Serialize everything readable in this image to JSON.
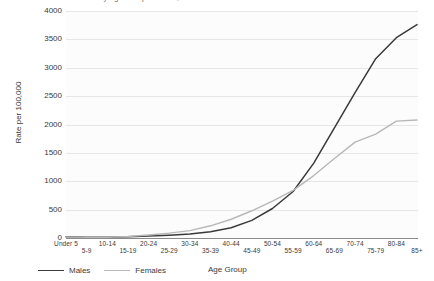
{
  "chart_data": {
    "type": "line",
    "title": "Rate of Cancer Incidence by Age Group and Sex, 2015",
    "xlabel": "Age Group",
    "ylabel": "Rate per 100,000",
    "ylim": [
      0,
      4000
    ],
    "yticks": [
      4000,
      3500,
      3000,
      2500,
      2000,
      1500,
      1000,
      500,
      0
    ],
    "grid": true,
    "legend_position": "bottom-left",
    "categories": [
      "Under 5",
      "5-9",
      "10-14",
      "15-19",
      "20-24",
      "25-29",
      "30-34",
      "35-39",
      "40-44",
      "45-49",
      "50-54",
      "55-59",
      "60-64",
      "65-69",
      "70-74",
      "75-79",
      "80-84",
      "85+"
    ],
    "series": [
      {
        "name": "Males",
        "color": "#3a3a3a",
        "values": [
          20,
          12,
          14,
          22,
          35,
          50,
          72,
          110,
          180,
          310,
          520,
          820,
          1320,
          1940,
          2560,
          3160,
          3530,
          3760
        ]
      },
      {
        "name": "Females",
        "color": "#b8b8b8",
        "values": [
          18,
          11,
          13,
          26,
          52,
          85,
          130,
          215,
          330,
          480,
          650,
          840,
          1100,
          1400,
          1690,
          1830,
          2060,
          2080
        ]
      }
    ]
  },
  "legend": {
    "items": [
      {
        "label": "Males",
        "color": "#3a3a3a",
        "width": "1.6px"
      },
      {
        "label": "Females",
        "color": "#b8b8b8",
        "width": "1.4px"
      }
    ]
  }
}
